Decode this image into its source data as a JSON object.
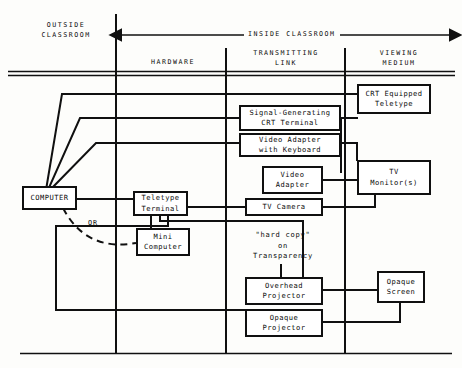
{
  "diagram": {
    "zones": {
      "outside": "OUTSIDE\nCLASSROOM",
      "inside": "INSIDE CLASSROOM",
      "columns": [
        {
          "label": "HARDWARE"
        },
        {
          "label": "TRANSMITTING\nLINK"
        },
        {
          "label": "VIEWING\nMEDIUM"
        }
      ]
    },
    "nodes": [
      {
        "id": "computer",
        "label": "COMPUTER"
      },
      {
        "id": "teletype-terminal",
        "label": "Teletype\nTerminal"
      },
      {
        "id": "mini-computer",
        "label": "Mini\nComputer"
      },
      {
        "id": "signal-generating-crt-terminal",
        "label": "Signal-Generating\nCRT Terminal"
      },
      {
        "id": "video-adapter-with-keyboard",
        "label": "Video Adapter\nwith Keyboard"
      },
      {
        "id": "video-adapter",
        "label": "Video\nAdapter"
      },
      {
        "id": "tv-camera",
        "label": "TV Camera"
      },
      {
        "id": "crt-equipped-teletype",
        "label": "CRT Equipped\nTeletype"
      },
      {
        "id": "tv-monitors",
        "label": "TV\nMonitor(s)"
      },
      {
        "id": "overhead-projector",
        "label": "Overhead\nProjector"
      },
      {
        "id": "opaque-projector",
        "label": "Opaque\nProjector"
      },
      {
        "id": "opaque-screen",
        "label": "Opaque\nScreen"
      }
    ],
    "captions": [
      {
        "id": "hard-copy",
        "label": "\"hard copy\"\non\nTransparency"
      },
      {
        "id": "or",
        "label": "OR"
      }
    ],
    "colors": {
      "ink": "#101010",
      "paper": "#fdfdfb"
    }
  }
}
